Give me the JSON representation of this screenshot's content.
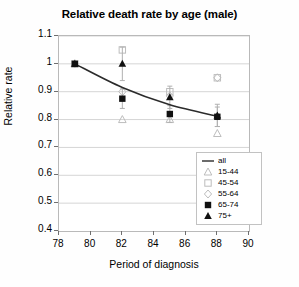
{
  "chart_data": {
    "type": "scatter",
    "title": "Relative death rate by age (male)",
    "xlabel": "Period of diagnosis",
    "ylabel": "Relative rate",
    "xlim": [
      78,
      90
    ],
    "ylim": [
      0.4,
      1.1
    ],
    "xticks": [
      78,
      80,
      82,
      84,
      86,
      88,
      90
    ],
    "yticks": [
      "0.4",
      "0.5",
      "0.6",
      "0.7",
      "0.8",
      "0.9",
      "1",
      "1.1"
    ],
    "grid": true,
    "legend_position": "inside-bottom-right",
    "x": [
      79,
      82,
      85,
      88
    ],
    "series": [
      {
        "name": "all",
        "marker": "line",
        "values": [
          1.0,
          0.915,
          0.853,
          0.812
        ]
      },
      {
        "name": "15-44",
        "marker": "triangle-open",
        "values": [
          1.0,
          0.8,
          0.8,
          0.75
        ]
      },
      {
        "name": "45-54",
        "marker": "square-open",
        "values": [
          1.0,
          1.05,
          0.9,
          0.95
        ]
      },
      {
        "name": "55-64",
        "marker": "diamond-open",
        "values": [
          1.0,
          0.9,
          0.885,
          0.95
        ]
      },
      {
        "name": "65-74",
        "marker": "square-filled",
        "values": [
          1.0,
          0.875,
          0.82,
          0.81
        ],
        "errors": [
          0.0,
          0.035,
          0.03,
          0.035
        ]
      },
      {
        "name": "75+",
        "marker": "triangle-filled",
        "values": [
          1.0,
          1.0,
          0.88,
          0.815
        ],
        "errors": [
          0.0,
          0.06,
          0.04,
          0.04
        ]
      }
    ],
    "legend_entries": [
      {
        "label": "all",
        "marker": "line"
      },
      {
        "label": "15-44",
        "marker": "triangle-open"
      },
      {
        "label": "45-54",
        "marker": "square-open"
      },
      {
        "label": "55-64",
        "marker": "diamond-open"
      },
      {
        "label": "65-74",
        "marker": "square-filled"
      },
      {
        "label": "75+",
        "marker": "triangle-filled"
      }
    ],
    "colors": {
      "line": "#2b2b2b",
      "marker_filled": "#111111",
      "marker_open": "#bdbdbd",
      "grid": "#d5d5d5",
      "axis": "#9a9a9a",
      "text": "#000000"
    }
  }
}
